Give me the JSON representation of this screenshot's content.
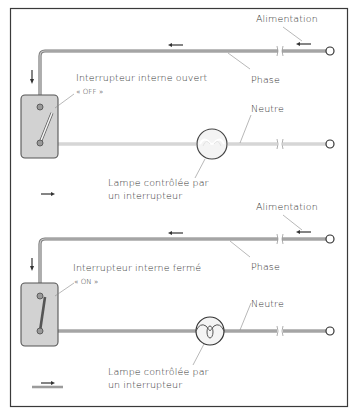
{
  "diagram": {
    "colors": {
      "frame": "#3a3a3a",
      "wire_phase": "#8c8c8c",
      "wire_neutral": "#d9d9d9",
      "switch_box": "#d6d6d6",
      "text": "#333333"
    },
    "top": {
      "state": "off",
      "labels": {
        "supply": "Alimentation",
        "phase": "Phase",
        "switch": "Interrupteur interne ouvert",
        "switch_state": "« OFF »",
        "neutral": "Neutre",
        "lamp_line1": "Lampe contrôlée par",
        "lamp_line2": "un interrupteur"
      }
    },
    "bottom": {
      "state": "on",
      "labels": {
        "supply": "Alimentation",
        "phase": "Phase",
        "switch": "Interrupteur interne fermé",
        "switch_state": "« ON »",
        "neutral": "Neutre",
        "lamp_line1": "Lampe contrôlée par",
        "lamp_line2": "un interrupteur"
      }
    },
    "icons": {
      "direction_arrows": "arrow-left / arrow-down / arrow-right",
      "lamp": "lamp-filament-icon",
      "terminal": "terminal-circle-icon"
    }
  }
}
